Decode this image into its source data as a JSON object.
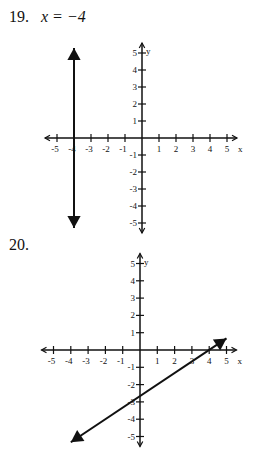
{
  "problems": [
    {
      "number": "19.",
      "equation": "x = −4",
      "graph": {
        "x_axis_label": "x",
        "y_axis_label": "y",
        "x_ticks": [
          "-5",
          "-4",
          "-3",
          "-2",
          "-1",
          "1",
          "2",
          "3",
          "4",
          "5"
        ],
        "y_ticks": [
          "5",
          "4",
          "3",
          "2",
          "1",
          "-1",
          "-2",
          "-3",
          "-4",
          "-5"
        ],
        "range": {
          "x": [
            -5,
            5
          ],
          "y": [
            -5,
            5
          ]
        },
        "line": {
          "type": "vertical",
          "x": -4,
          "from": [
            -4,
            5.3
          ],
          "to": [
            -4,
            -5.3
          ]
        }
      }
    },
    {
      "number": "20.",
      "equation": "",
      "graph": {
        "x_axis_label": "x",
        "y_axis_label": "y",
        "x_ticks": [
          "-5",
          "-4",
          "-3",
          "-2",
          "-1",
          "1",
          "2",
          "3",
          "4",
          "5"
        ],
        "y_ticks": [
          "5",
          "4",
          "3",
          "2",
          "1",
          "-1",
          "-2",
          "-3",
          "-4",
          "-5"
        ],
        "range": {
          "x": [
            -5,
            5
          ],
          "y": [
            -5,
            5
          ]
        },
        "line": {
          "type": "sloped",
          "slope": 0.6667,
          "y_intercept": -2.667,
          "x_intercept": 4,
          "from": [
            -4,
            -5.33
          ],
          "to": [
            5,
            0.67
          ]
        }
      }
    }
  ],
  "chart_data": [
    {
      "type": "line",
      "title": "19. x = −4",
      "xlabel": "x",
      "ylabel": "y",
      "xlim": [
        -5,
        5
      ],
      "ylim": [
        -5,
        5
      ],
      "x_ticks": [
        -5,
        -4,
        -3,
        -2,
        -1,
        1,
        2,
        3,
        4,
        5
      ],
      "y_ticks": [
        -5,
        -4,
        -3,
        -2,
        -1,
        1,
        2,
        3,
        4,
        5
      ],
      "grid": false,
      "series": [
        {
          "name": "x = -4",
          "points": [
            [
              -4,
              5.3
            ],
            [
              -4,
              -5.3
            ]
          ],
          "arrows": "both"
        }
      ]
    },
    {
      "type": "line",
      "title": "20.",
      "xlabel": "x",
      "ylabel": "y",
      "xlim": [
        -5,
        5
      ],
      "ylim": [
        -5,
        5
      ],
      "x_ticks": [
        -5,
        -4,
        -3,
        -2,
        -1,
        1,
        2,
        3,
        4,
        5
      ],
      "y_ticks": [
        -5,
        -4,
        -3,
        -2,
        -1,
        1,
        2,
        3,
        4,
        5
      ],
      "grid": false,
      "series": [
        {
          "name": "y = (2/3)x - 8/3",
          "points": [
            [
              -4,
              -5.33
            ],
            [
              5,
              0.67
            ]
          ],
          "arrows": "both"
        }
      ]
    }
  ]
}
